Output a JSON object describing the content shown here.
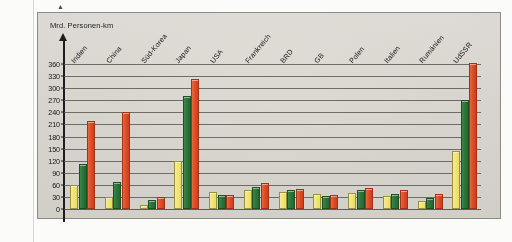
{
  "figure": {
    "corner_marker": "▲",
    "y_axis_title": "Mrd.\nPersonen-km",
    "frame_color": "#8d8a85",
    "background_color": "#dedbd6"
  },
  "legend_colors": {
    "series_1": "#f0e36a",
    "series_2": "#2f7a3c",
    "series_3": "#e4502a"
  },
  "chart_data": {
    "type": "bar",
    "title": "",
    "subtitle": "",
    "xlabel": "",
    "ylabel": "Mrd. Personen-km",
    "ylim": [
      0,
      360
    ],
    "yticks": [
      0,
      30,
      60,
      90,
      120,
      150,
      180,
      210,
      240,
      270,
      300,
      330,
      360
    ],
    "grid": true,
    "legend_position": "none",
    "categories": [
      "Indien",
      "China",
      "Süd-Korea",
      "Japan",
      "USA",
      "Frankreich",
      "BRD",
      "GB",
      "Polen",
      "Italien",
      "Rumänien",
      "UdSSR"
    ],
    "series": [
      {
        "name": "series_1",
        "color": "#f0e36a",
        "values": [
          60,
          30,
          10,
          120,
          42,
          48,
          42,
          38,
          40,
          33,
          20,
          143
        ]
      },
      {
        "name": "series_2",
        "color": "#2f7a3c",
        "values": [
          113,
          68,
          22,
          280,
          35,
          55,
          48,
          33,
          46,
          38,
          28,
          270
        ]
      },
      {
        "name": "series_3",
        "color": "#e4502a",
        "values": [
          218,
          240,
          30,
          323,
          34,
          65,
          50,
          34,
          52,
          48,
          38,
          362
        ]
      }
    ]
  }
}
